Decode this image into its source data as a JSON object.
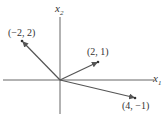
{
  "diagram": {
    "type": "vector-plot",
    "axes": {
      "x_label": "x",
      "x_sub": "1",
      "y_label": "x",
      "y_sub": "2"
    },
    "vectors": [
      {
        "x": -2,
        "y": 2,
        "label": "(−2, 2)"
      },
      {
        "x": 2,
        "y": 1,
        "label": "(2, 1)"
      },
      {
        "x": 4,
        "y": -1,
        "label": "(4, −1)"
      }
    ],
    "colors": {
      "axis": "#555555",
      "vector": "#555555",
      "text": "#333333"
    }
  }
}
